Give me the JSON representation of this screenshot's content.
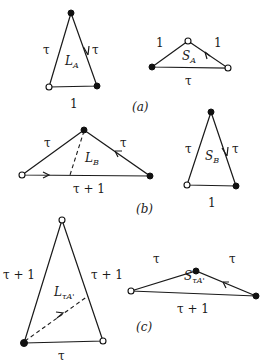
{
  "figure": {
    "panels": [
      {
        "caption": "(a)",
        "triangles": [
          {
            "id": "L_A",
            "name_main": "L",
            "name_sub": "A",
            "edges": {
              "left": "τ",
              "right": "τ",
              "base": "1"
            },
            "vertices": {
              "apex": "filled",
              "base_left": "open",
              "base_right": "filled"
            },
            "arrow": "on right edge, pointing down"
          },
          {
            "id": "S_A",
            "name_main": "S",
            "name_sub": "A",
            "edges": {
              "left": "1",
              "right": "1",
              "base": "τ"
            },
            "vertices": {
              "apex": "open",
              "base_left": "filled",
              "base_right": "open"
            },
            "arrow": "on right edge, pointing up"
          }
        ]
      },
      {
        "caption": "(b)",
        "triangles": [
          {
            "id": "L_B",
            "name_main": "L",
            "name_sub": "B",
            "edges": {
              "left": "τ",
              "right": "τ",
              "base": "τ + 1"
            },
            "vertices": {
              "apex": "filled",
              "base_left": "open",
              "base_right": "filled"
            },
            "arrow": "on right edge pointing up; on base pointing right",
            "dashed": "from apex to base"
          },
          {
            "id": "S_B",
            "name_main": "S",
            "name_sub": "B",
            "edges": {
              "left": "τ",
              "right": "τ",
              "base": "1"
            },
            "vertices": {
              "apex": "filled",
              "base_left": "open",
              "base_right": "filled"
            },
            "arrow": "on right edge, pointing down"
          }
        ]
      },
      {
        "caption": "(c)",
        "triangles": [
          {
            "id": "L_τA'",
            "name_main": "L",
            "name_sub": "τA'",
            "edges": {
              "left": "τ + 1",
              "right": "τ + 1",
              "base": "τ"
            },
            "vertices": {
              "apex": "open",
              "base_left": "filled",
              "base_right": "open"
            },
            "dashed": "from base-left vertex to right edge, with arrow"
          },
          {
            "id": "S_τA'",
            "name_main": "S",
            "name_sub": "τA'",
            "edges": {
              "left": "τ",
              "right": "τ",
              "base": "τ + 1"
            },
            "vertices": {
              "apex": "filled",
              "base_left": "open",
              "base_right": "filled"
            },
            "arrow": "on right edge, pointing up"
          }
        ]
      }
    ]
  },
  "labels": {
    "tau": "τ",
    "one": "1",
    "tau_plus_one": "τ + 1",
    "cap_a": "(a)",
    "cap_b": "(b)",
    "cap_c": "(c)",
    "L": "L",
    "S": "S",
    "sub_A": "A",
    "sub_B": "B",
    "sub_tauA": "τA'"
  }
}
